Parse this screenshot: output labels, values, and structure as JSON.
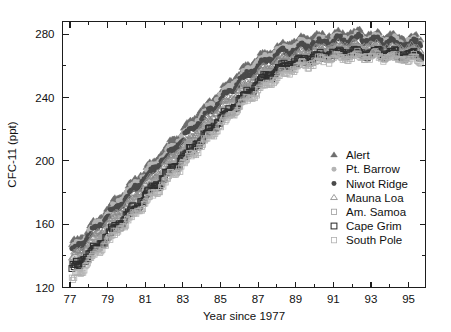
{
  "chart_data": {
    "type": "scatter",
    "title": "",
    "xlabel": "Year since 1977",
    "ylabel": "CFC-11 (ppt)",
    "xlim": [
      76.6,
      95.9
    ],
    "ylim": [
      120,
      288
    ],
    "grid": false,
    "xticks": [
      77,
      79,
      81,
      83,
      85,
      87,
      89,
      91,
      93,
      95
    ],
    "xtick_labels": [
      "77",
      "79",
      "81",
      "83",
      "85",
      "87",
      "89",
      "91",
      "93",
      "95"
    ],
    "xminor_step": 1,
    "yticks": [
      120,
      160,
      200,
      240,
      280
    ],
    "ytick_labels": [
      "120",
      "160",
      "200",
      "240",
      "280"
    ],
    "yminor_step": 20,
    "legend_position": "center-right",
    "series": [
      {
        "name": "Alert",
        "marker": "filled-triangle",
        "color": "#6e6e6e",
        "size": 3.4,
        "offset": 6.0,
        "x": [
          77.1,
          77.4,
          77.7,
          78.0,
          78.3,
          78.6,
          78.9,
          79.2,
          79.5,
          79.8,
          80.1,
          80.4,
          80.7,
          81.0,
          81.3,
          81.6,
          81.9,
          82.2,
          82.5,
          82.8,
          83.1,
          83.4,
          83.7,
          84.0,
          84.3,
          84.6,
          84.9,
          85.2,
          85.5,
          85.8,
          86.1,
          86.4,
          86.7,
          87.0,
          87.3,
          87.6,
          87.9,
          88.2,
          88.5,
          88.8,
          89.1,
          89.4,
          89.7,
          90.0,
          90.3,
          90.6,
          90.9,
          91.2,
          91.5,
          91.8,
          92.1,
          92.4,
          92.7,
          93.0,
          93.3,
          93.6,
          93.9,
          94.2,
          94.5,
          94.8,
          95.1,
          95.4,
          95.7
        ],
        "y": [
          146,
          149,
          152,
          156,
          160,
          163,
          167,
          171,
          175,
          178,
          182,
          186,
          190,
          193,
          197,
          200,
          204,
          208,
          212,
          215,
          219,
          223,
          227,
          231,
          234,
          238,
          242,
          245,
          249,
          252,
          255,
          258,
          261,
          264,
          266,
          268,
          270,
          272,
          273,
          274,
          275,
          276,
          277,
          277,
          278,
          278,
          279,
          279,
          279,
          280,
          280,
          280,
          279,
          279,
          279,
          278,
          278,
          278,
          277,
          277,
          277,
          277,
          276
        ]
      },
      {
        "name": "Pt. Barrow",
        "marker": "filled-circle",
        "color": "#b4b4b4",
        "size": 3.2,
        "offset": 4.0,
        "x": [
          77.1,
          77.4,
          77.7,
          78.0,
          78.3,
          78.6,
          78.9,
          79.2,
          79.5,
          79.8,
          80.1,
          80.4,
          80.7,
          81.0,
          81.3,
          81.6,
          81.9,
          82.2,
          82.5,
          82.8,
          83.1,
          83.4,
          83.7,
          84.0,
          84.3,
          84.6,
          84.9,
          85.2,
          85.5,
          85.8,
          86.1,
          86.4,
          86.7,
          87.0,
          87.3,
          87.6,
          87.9,
          88.2,
          88.5,
          88.8,
          89.1,
          89.4,
          89.7,
          90.0,
          90.3,
          90.6,
          90.9,
          91.2,
          91.5,
          91.8,
          92.1,
          92.4,
          92.7,
          93.0,
          93.3,
          93.6,
          93.9,
          94.2,
          94.5,
          94.8,
          95.1,
          95.4,
          95.7
        ],
        "y": [
          144,
          147,
          150,
          154,
          158,
          161,
          165,
          169,
          173,
          176,
          180,
          184,
          188,
          191,
          195,
          198,
          202,
          206,
          210,
          213,
          217,
          221,
          225,
          229,
          232,
          236,
          240,
          243,
          247,
          250,
          253,
          256,
          259,
          262,
          264,
          266,
          268,
          270,
          271,
          272,
          273,
          274,
          275,
          275,
          276,
          276,
          277,
          277,
          277,
          278,
          278,
          278,
          277,
          277,
          277,
          276,
          276,
          276,
          275,
          275,
          275,
          275,
          274
        ]
      },
      {
        "name": "Niwot Ridge",
        "marker": "filled-circle-dark",
        "color": "#4a4a4a",
        "size": 3.2,
        "offset": 1.5,
        "x": [
          77.1,
          77.4,
          77.7,
          78.0,
          78.3,
          78.6,
          78.9,
          79.2,
          79.5,
          79.8,
          80.1,
          80.4,
          80.7,
          81.0,
          81.3,
          81.6,
          81.9,
          82.2,
          82.5,
          82.8,
          83.1,
          83.4,
          83.7,
          84.0,
          84.3,
          84.6,
          84.9,
          85.2,
          85.5,
          85.8,
          86.1,
          86.4,
          86.7,
          87.0,
          87.3,
          87.6,
          87.9,
          88.2,
          88.5,
          88.8,
          89.1,
          89.4,
          89.7,
          90.0,
          90.3,
          90.6,
          90.9,
          91.2,
          91.5,
          91.8,
          92.1,
          92.4,
          92.7,
          93.0,
          93.3,
          93.6,
          93.9,
          94.2,
          94.5,
          94.8,
          95.1,
          95.4,
          95.7
        ],
        "y": [
          142,
          145,
          148,
          152,
          156,
          159,
          163,
          167,
          170,
          174,
          178,
          182,
          185,
          189,
          192,
          196,
          200,
          203,
          207,
          211,
          215,
          218,
          222,
          226,
          230,
          233,
          237,
          241,
          244,
          247,
          251,
          254,
          257,
          259,
          262,
          264,
          266,
          268,
          269,
          270,
          271,
          272,
          273,
          274,
          274,
          275,
          275,
          276,
          276,
          276,
          277,
          277,
          276,
          276,
          276,
          275,
          275,
          275,
          274,
          274,
          274,
          274,
          273
        ]
      },
      {
        "name": "Mauna Loa",
        "marker": "open-triangle",
        "color": "#8a8a8a",
        "size": 3.4,
        "offset": -1.5,
        "x": [
          77.1,
          77.4,
          77.7,
          78.0,
          78.3,
          78.6,
          78.9,
          79.2,
          79.5,
          79.8,
          80.1,
          80.4,
          80.7,
          81.0,
          81.3,
          81.6,
          81.9,
          82.2,
          82.5,
          82.8,
          83.1,
          83.4,
          83.7,
          84.0,
          84.3,
          84.6,
          84.9,
          85.2,
          85.5,
          85.8,
          86.1,
          86.4,
          86.7,
          87.0,
          87.3,
          87.6,
          87.9,
          88.2,
          88.5,
          88.8,
          89.1,
          89.4,
          89.7,
          90.0,
          90.3,
          90.6,
          90.9,
          91.2,
          91.5,
          91.8,
          92.1,
          92.4,
          92.7,
          93.0,
          93.3,
          93.6,
          93.9,
          94.2,
          94.5,
          94.8,
          95.1,
          95.4,
          95.7
        ],
        "y": [
          138,
          141,
          144,
          148,
          152,
          155,
          159,
          163,
          166,
          170,
          174,
          177,
          181,
          185,
          188,
          192,
          196,
          199,
          203,
          207,
          210,
          214,
          218,
          221,
          225,
          229,
          232,
          236,
          239,
          243,
          246,
          249,
          252,
          255,
          258,
          260,
          262,
          264,
          265,
          266,
          267,
          268,
          269,
          270,
          271,
          271,
          272,
          272,
          273,
          273,
          273,
          273,
          273,
          273,
          272,
          272,
          272,
          271,
          271,
          271,
          271,
          270,
          270
        ]
      },
      {
        "name": "Am. Samoa",
        "marker": "open-square-light",
        "color": "#9d9d9d",
        "size": 3.6,
        "offset": -5.0,
        "x": [
          77.1,
          77.4,
          77.7,
          78.0,
          78.3,
          78.6,
          78.9,
          79.2,
          79.5,
          79.8,
          80.1,
          80.4,
          80.7,
          81.0,
          81.3,
          81.6,
          81.9,
          82.2,
          82.5,
          82.8,
          83.1,
          83.4,
          83.7,
          84.0,
          84.3,
          84.6,
          84.9,
          85.2,
          85.5,
          85.8,
          86.1,
          86.4,
          86.7,
          87.0,
          87.3,
          87.6,
          87.9,
          88.2,
          88.5,
          88.8,
          89.1,
          89.4,
          89.7,
          90.0,
          90.3,
          90.6,
          90.9,
          91.2,
          91.5,
          91.8,
          92.1,
          92.4,
          92.7,
          93.0,
          93.3,
          93.6,
          93.9,
          94.2,
          94.5,
          94.8,
          95.1,
          95.4,
          95.7
        ],
        "y": [
          134,
          137,
          140,
          144,
          147,
          151,
          155,
          158,
          162,
          166,
          169,
          173,
          177,
          180,
          184,
          188,
          191,
          195,
          199,
          202,
          206,
          210,
          213,
          217,
          221,
          224,
          228,
          231,
          235,
          238,
          242,
          245,
          248,
          251,
          254,
          256,
          258,
          260,
          262,
          263,
          264,
          265,
          266,
          267,
          268,
          268,
          269,
          269,
          270,
          270,
          270,
          270,
          270,
          270,
          270,
          269,
          269,
          269,
          268,
          268,
          268,
          268,
          267
        ]
      },
      {
        "name": "Cape Grim",
        "marker": "open-square-dark",
        "color": "#2f2f2f",
        "size": 4.0,
        "offset": -7.5,
        "x": [
          77.1,
          77.4,
          77.7,
          78.0,
          78.3,
          78.6,
          78.9,
          79.2,
          79.5,
          79.8,
          80.1,
          80.4,
          80.7,
          81.0,
          81.3,
          81.6,
          81.9,
          82.2,
          82.5,
          82.8,
          83.1,
          83.4,
          83.7,
          84.0,
          84.3,
          84.6,
          84.9,
          85.2,
          85.5,
          85.8,
          86.1,
          86.4,
          86.7,
          87.0,
          87.3,
          87.6,
          87.9,
          88.2,
          88.5,
          88.8,
          89.1,
          89.4,
          89.7,
          90.0,
          90.3,
          90.6,
          90.9,
          91.2,
          91.5,
          91.8,
          92.1,
          92.4,
          92.7,
          93.0,
          93.3,
          93.6,
          93.9,
          94.2,
          94.5,
          94.8,
          95.1,
          95.4,
          95.7
        ],
        "y": [
          132,
          135,
          138,
          141,
          145,
          148,
          152,
          156,
          159,
          163,
          167,
          170,
          174,
          178,
          181,
          185,
          189,
          192,
          196,
          200,
          203,
          207,
          211,
          214,
          218,
          222,
          225,
          229,
          232,
          236,
          239,
          243,
          246,
          249,
          252,
          254,
          257,
          259,
          260,
          262,
          263,
          264,
          265,
          266,
          266,
          267,
          268,
          268,
          269,
          269,
          269,
          269,
          269,
          269,
          269,
          268,
          268,
          268,
          267,
          267,
          267,
          267,
          266
        ]
      },
      {
        "name": "South Pole",
        "marker": "open-square-faint",
        "color": "#b0b0b0",
        "size": 3.6,
        "offset": -10.5,
        "x": [
          77.1,
          77.4,
          77.7,
          78.0,
          78.3,
          78.6,
          78.9,
          79.2,
          79.5,
          79.8,
          80.1,
          80.4,
          80.7,
          81.0,
          81.3,
          81.6,
          81.9,
          82.2,
          82.5,
          82.8,
          83.1,
          83.4,
          83.7,
          84.0,
          84.3,
          84.6,
          84.9,
          85.2,
          85.5,
          85.8,
          86.1,
          86.4,
          86.7,
          87.0,
          87.3,
          87.6,
          87.9,
          88.2,
          88.5,
          88.8,
          89.1,
          89.4,
          89.7,
          90.0,
          90.3,
          90.6,
          90.9,
          91.2,
          91.5,
          91.8,
          92.1,
          92.4,
          92.7,
          93.0,
          93.3,
          93.6,
          93.9,
          94.2,
          94.5,
          94.8,
          95.1,
          95.4,
          95.7
        ],
        "y": [
          125,
          129,
          133,
          137,
          141,
          145,
          149,
          152,
          156,
          160,
          163,
          167,
          171,
          174,
          178,
          182,
          185,
          189,
          193,
          196,
          200,
          204,
          207,
          211,
          215,
          218,
          222,
          225,
          229,
          232,
          236,
          239,
          242,
          245,
          248,
          251,
          253,
          255,
          257,
          259,
          260,
          261,
          262,
          263,
          264,
          265,
          265,
          266,
          266,
          267,
          267,
          267,
          267,
          267,
          267,
          266,
          266,
          266,
          265,
          265,
          265,
          265,
          264
        ]
      }
    ]
  },
  "legend": {
    "items": [
      {
        "label": "Alert"
      },
      {
        "label": "Pt. Barrow"
      },
      {
        "label": "Niwot Ridge"
      },
      {
        "label": "Mauna Loa"
      },
      {
        "label": "Am. Samoa"
      },
      {
        "label": "Cape Grim"
      },
      {
        "label": "South Pole"
      }
    ]
  }
}
